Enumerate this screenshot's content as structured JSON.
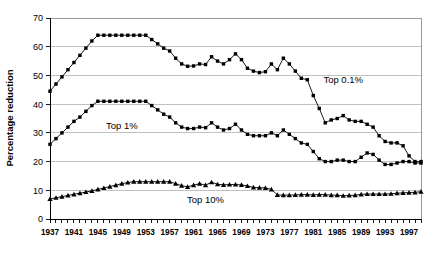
{
  "chart_data": {
    "type": "line",
    "title": "",
    "xlabel": "",
    "ylabel": "Percentage reduction",
    "xlim": [
      1937,
      1999
    ],
    "ylim": [
      0,
      70
    ],
    "ytick_step": 10,
    "grid": true,
    "legend_position": "inline-annotations",
    "yticks": [
      "0",
      "10",
      "20",
      "30",
      "40",
      "50",
      "60",
      "70"
    ],
    "xticks": [
      "1937",
      "1941",
      "1945",
      "1949",
      "1953",
      "1957",
      "1961",
      "1965",
      "1969",
      "1973",
      "1977",
      "1981",
      "1985",
      "1989",
      "1993",
      "1997"
    ],
    "x": [
      1937,
      1938,
      1939,
      1940,
      1941,
      1942,
      1943,
      1944,
      1945,
      1946,
      1947,
      1948,
      1949,
      1950,
      1951,
      1952,
      1953,
      1954,
      1955,
      1956,
      1957,
      1958,
      1959,
      1960,
      1961,
      1962,
      1963,
      1964,
      1965,
      1966,
      1967,
      1968,
      1969,
      1970,
      1971,
      1972,
      1973,
      1974,
      1975,
      1976,
      1977,
      1978,
      1979,
      1980,
      1981,
      1982,
      1983,
      1984,
      1985,
      1986,
      1987,
      1988,
      1989,
      1990,
      1991,
      1992,
      1993,
      1994,
      1995,
      1996,
      1997,
      1998,
      1999
    ],
    "series": [
      {
        "name": "Top 0.1%",
        "marker": "square",
        "annotation": "Top 0.1%",
        "values": [
          44.5,
          47.0,
          49.5,
          52.0,
          54.5,
          57.0,
          59.5,
          62.0,
          64.0,
          64.0,
          64.0,
          64.0,
          64.0,
          64.0,
          64.0,
          64.0,
          64.0,
          62.5,
          61.0,
          59.5,
          58.5,
          56.0,
          54.0,
          53.2,
          53.3,
          54.0,
          53.8,
          56.5,
          55.0,
          54.0,
          55.5,
          57.5,
          55.5,
          52.5,
          51.5,
          51.0,
          51.3,
          54.0,
          52.0,
          56.0,
          54.0,
          51.5,
          49.0,
          48.5,
          43.0,
          38.5,
          33.5,
          34.5,
          35.0,
          36.0,
          34.5,
          34.0,
          34.0,
          33.0,
          32.0,
          29.0,
          27.0,
          26.5,
          26.5,
          25.5,
          22.0,
          20.0,
          20.0
        ]
      },
      {
        "name": "Top 1%",
        "marker": "square",
        "annotation": "Top 1%",
        "values": [
          26.0,
          28.0,
          30.0,
          32.0,
          34.0,
          35.5,
          37.5,
          39.5,
          41.0,
          41.0,
          41.0,
          41.0,
          41.0,
          41.0,
          41.0,
          41.0,
          41.0,
          39.5,
          38.0,
          36.5,
          35.5,
          33.5,
          32.0,
          31.5,
          31.5,
          32.0,
          31.8,
          33.5,
          32.0,
          31.0,
          31.5,
          33.0,
          31.0,
          29.5,
          29.0,
          29.0,
          29.0,
          30.0,
          29.0,
          31.0,
          29.5,
          28.0,
          26.5,
          26.0,
          23.5,
          21.0,
          20.0,
          20.0,
          20.5,
          20.5,
          20.0,
          20.0,
          21.5,
          23.0,
          22.5,
          20.5,
          19.0,
          19.0,
          19.5,
          20.0,
          20.0,
          19.5,
          19.5
        ]
      },
      {
        "name": "Top 10%",
        "marker": "triangle",
        "annotation": "Top 10%",
        "values": [
          7.0,
          7.4,
          7.8,
          8.2,
          8.6,
          9.0,
          9.4,
          9.8,
          10.3,
          10.8,
          11.3,
          11.8,
          12.3,
          12.7,
          13.0,
          13.0,
          13.0,
          13.0,
          13.0,
          13.0,
          13.0,
          12.3,
          11.6,
          11.2,
          11.8,
          12.3,
          11.8,
          12.8,
          12.1,
          11.9,
          12.0,
          12.0,
          11.9,
          11.5,
          11.0,
          10.9,
          10.8,
          10.3,
          8.4,
          8.3,
          8.3,
          8.4,
          8.5,
          8.5,
          8.4,
          8.5,
          8.5,
          8.3,
          8.3,
          8.1,
          8.2,
          8.3,
          8.6,
          8.7,
          8.7,
          8.7,
          8.7,
          8.8,
          9.0,
          9.1,
          9.2,
          9.3,
          9.5
        ]
      }
    ],
    "annotations": [
      {
        "label": "Top 0.1%",
        "x": 1986,
        "y": 47.5
      },
      {
        "label": "Top 1%",
        "x": 1949,
        "y": 31.5
      },
      {
        "label": "Top 10%",
        "x": 1963,
        "y": 5.4
      }
    ],
    "colors": {
      "series": "#000000",
      "grid": "#b0b0b0",
      "axis": "#000000",
      "background": "#ffffff"
    }
  }
}
